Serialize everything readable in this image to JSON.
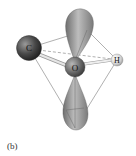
{
  "figure": {
    "panel_label": "(b)",
    "atoms": [
      {
        "symbol": "C",
        "cx": 29,
        "cy": 48,
        "r": 12.5,
        "tone": "dark"
      },
      {
        "symbol": "O",
        "cx": 75,
        "cy": 67,
        "r": 10,
        "tone": "mid"
      },
      {
        "symbol": "H",
        "cx": 117,
        "cy": 60,
        "r": 6,
        "tone": "light"
      }
    ],
    "lobes": [
      "top-lone-pair-orbital",
      "bottom-lone-pair-orbital"
    ],
    "tetrahedron_vertices": {
      "top": [
        87,
        30
      ],
      "left": [
        29,
        48
      ],
      "right": [
        117,
        60
      ],
      "bottom": [
        75,
        128
      ]
    },
    "colors": {
      "lobe": "#8c8c8c",
      "lobe_highlight": "#d0d0d0",
      "edge_line": "#777777",
      "bond": "#cfcfcf"
    }
  }
}
